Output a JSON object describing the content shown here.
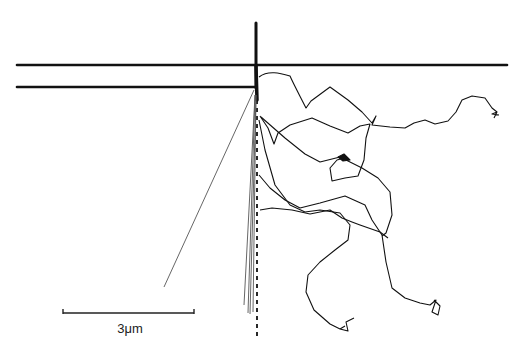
{
  "figure": {
    "scale_bar": {
      "label": "3μm",
      "x1": 63,
      "x2": 194,
      "y": 313
    },
    "colors": {
      "ink": "#111111",
      "background": "#ffffff",
      "thin_line": "#555555"
    },
    "structure": {
      "vertical_post": {
        "x": 256,
        "y1": 23,
        "y2": 88
      },
      "horizontal_line_top": {
        "x1": 17,
        "x2": 507,
        "y": 65
      },
      "horizontal_line_lower": {
        "x1": 17,
        "x2": 256,
        "y": 87
      },
      "dashed_axis": {
        "x": 257,
        "y1": 88,
        "y2": 335
      }
    }
  }
}
